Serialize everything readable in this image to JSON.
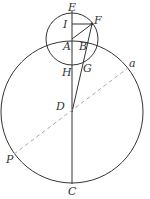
{
  "diagram": {
    "stroke_color": "#333333",
    "dashed_color": "#aaaaaa",
    "labels": {
      "E": "E",
      "I": "I",
      "F": "F",
      "A": "A",
      "B": "B",
      "H": "H",
      "G": "G",
      "a": "a",
      "D": "D",
      "P": "P",
      "C": "C"
    }
  }
}
